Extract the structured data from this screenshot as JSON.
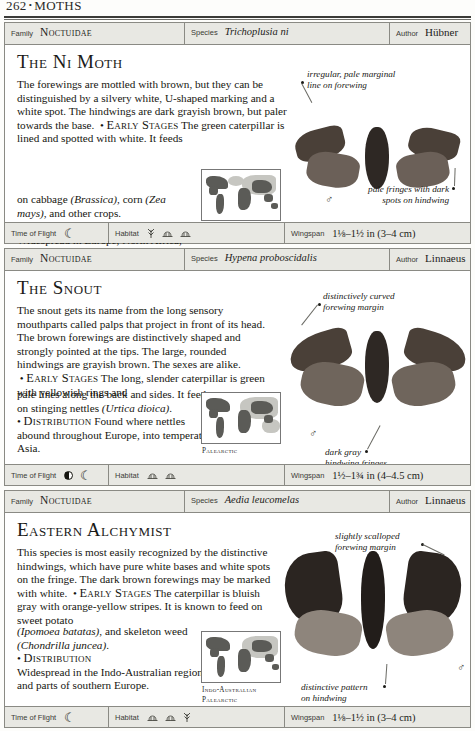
{
  "page": {
    "number": "262",
    "separator": "•",
    "section": "MOTHS"
  },
  "labels": {
    "family": "Family",
    "species": "Species",
    "author": "Author",
    "time_of_flight": "Time of Flight",
    "habitat": "Habitat",
    "wingspan": "Wingspan"
  },
  "entries": [
    {
      "family": "Noctuidae",
      "species": "Trichoplusia ni",
      "author": "Hübner",
      "common_name": "The Ni Moth",
      "description_1": "The forewings are mottled with brown, but they can be distinguished by a silvery white, U-shaped marking and a white spot. The hindwings are dark grayish brown, but paler towards the base.",
      "early_stages_heading": "Early Stages",
      "early_stages_lead": "The green caterpillar is lined and spotted with white. It feeds",
      "description_2_pre": "on cabbage ",
      "description_2_ital_1": "(Brassica)",
      "description_2_mid": ", corn ",
      "description_2_ital_2": "(Zea mays)",
      "description_2_post": ", and other crops.",
      "distribution_heading": "Distribution",
      "distribution_text": "Widespread in Europe, North Africa, and the temperate northern hemisphere.",
      "map_caption": "Holarctic",
      "annotations": [
        "irregular, pale marginal\nline on forewing",
        "pale fringes with dark\nspots on hindwing"
      ],
      "annotation_1_line_1": "irregular, pale marginal",
      "annotation_1_line_2": "line on forewing",
      "annotation_2_line_1": "pale fringes with dark",
      "annotation_2_line_2": "spots on hindwing",
      "sex_symbol": "♂",
      "time_of_flight_icons": [
        "crescent-moon"
      ],
      "habitat_icons": [
        "grass-tuft",
        "shrub",
        "shrub"
      ],
      "wingspan": "1⅛–1½ in (3–4 cm)"
    },
    {
      "family": "Noctuidae",
      "species": "Hypena proboscidalis",
      "author": "Linnaeus",
      "common_name": "The Snout",
      "description_1": "The snout gets its name from the long sensory mouthparts called palps that project in front of its head. The brown forewings are distinctively shaped and strongly pointed at the tips. The large, rounded hindwings are grayish brown. The sexes are alike.",
      "early_stages_heading": "Early Stages",
      "early_stages_lead": "The long, slender caterpillar is green with yellowish rings and",
      "description_2_pre": "pale lines along the back and sides. It feeds on stinging nettles ",
      "description_2_ital_1": "(Urtica dioica)",
      "description_2_post": ".",
      "distribution_heading": "Distribution",
      "distribution_text": "Found where nettles abound throughout Europe, into temperate Asia.",
      "map_caption": "Palearctic",
      "annotation_1_line_1": "distinctively curved",
      "annotation_1_line_2": "forewing margin",
      "annotation_2_line_1": "dark gray",
      "annotation_2_line_2": "hindwing fringes",
      "sex_symbol": "♂",
      "time_of_flight_icons": [
        "half-moon",
        "crescent-moon"
      ],
      "habitat_icons": [
        "shrub",
        "shrub"
      ],
      "wingspan": "1½–1¾ in (4–4.5 cm)"
    },
    {
      "family": "Noctuidae",
      "species": "Aedia leucomelas",
      "author": "Linnaeus",
      "common_name": "Eastern Alchymist",
      "description_1": "This species is most easily recognized by the distinctive hindwings, which have pure white bases and white spots on the fringe. The dark brown forewings may be marked with white.",
      "early_stages_heading": "Early Stages",
      "early_stages_lead": "The caterpillar is bluish gray with orange-yellow stripes. It is known to feed on sweet potato",
      "description_2_ital_1": "(Ipomoea batatas)",
      "description_2_mid": ", and skeleton weed ",
      "description_2_ital_2": "(Chondrilla juncea)",
      "description_2_post": ".",
      "distribution_heading": "Distribution",
      "distribution_text": "Widespread in the Indo-Australian region and parts of southern Europe.",
      "map_caption_line_1": "Indo-Australian",
      "map_caption_line_2": "Palearctic",
      "annotation_1_line_1": "slightly scalloped",
      "annotation_1_line_2": "forewing margin",
      "annotation_2_line_1": "distinctive pattern",
      "annotation_2_line_2": "on hindwing",
      "sex_symbol": "♂",
      "time_of_flight_icons": [
        "crescent-moon"
      ],
      "habitat_icons": [
        "shrub",
        "shrub",
        "grass-tuft"
      ],
      "wingspan": "1⅛–1½ in (3–4 cm)"
    }
  ],
  "colors": {
    "rule": "#3b3b38",
    "panel_border": "#8a8a84",
    "strip_bg": "#e8e8e3",
    "map_land": "#5b5b57",
    "map_light": "#c6c6c1",
    "text": "#16160f"
  }
}
